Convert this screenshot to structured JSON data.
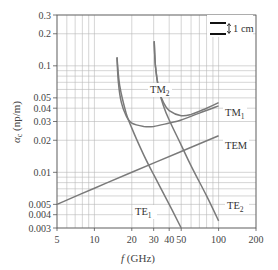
{
  "chart_data": {
    "type": "line",
    "title": "",
    "xlabel": "f (GHz)",
    "ylabel": "αc (np/m)",
    "xscale": "log",
    "yscale": "log",
    "xlim": [
      5,
      200
    ],
    "ylim": [
      0.003,
      0.3
    ],
    "grid": true,
    "x_ticks": [
      5,
      10,
      20,
      30,
      40,
      50,
      100,
      200
    ],
    "x_tick_labels": [
      "5",
      "10",
      "20",
      "30",
      "40",
      "50",
      "100",
      "200"
    ],
    "y_ticks": [
      0.003,
      0.004,
      0.005,
      0.01,
      0.02,
      0.03,
      0.04,
      0.05,
      0.1,
      0.2,
      0.3
    ],
    "y_tick_labels": [
      "0.003",
      "0.004",
      "0.005",
      "0.01",
      "0.02",
      "0.03",
      "0.04",
      "0.05",
      "0.1",
      "0.2",
      "0.3"
    ],
    "legend_annotation": "1 cm",
    "series": [
      {
        "name": "TEM",
        "label": "TEM",
        "x": [
          5,
          10,
          20,
          50,
          100
        ],
        "y": [
          0.005,
          0.0071,
          0.01,
          0.0157,
          0.022
        ]
      },
      {
        "name": "TE1",
        "label": "TE",
        "subscript": "1",
        "x": [
          15.2,
          16,
          18,
          20,
          25,
          30,
          40,
          50
        ],
        "y": [
          0.12,
          0.065,
          0.036,
          0.026,
          0.0145,
          0.0095,
          0.005,
          0.003
        ]
      },
      {
        "name": "TM1",
        "label": "TM",
        "subscript": "1",
        "x": [
          15.2,
          15.6,
          16.5,
          18,
          20,
          25,
          30,
          40,
          50,
          70,
          100
        ],
        "y": [
          0.12,
          0.07,
          0.045,
          0.034,
          0.029,
          0.027,
          0.027,
          0.029,
          0.031,
          0.036,
          0.042
        ]
      },
      {
        "name": "TM2",
        "label": "TM",
        "subscript": "2",
        "x": [
          30.3,
          31,
          33,
          36,
          40,
          50,
          60,
          80,
          100
        ],
        "y": [
          0.17,
          0.1,
          0.06,
          0.045,
          0.038,
          0.034,
          0.035,
          0.04,
          0.045
        ]
      },
      {
        "name": "TE2",
        "label": "TE",
        "subscript": "2",
        "x": [
          30.3,
          31,
          33,
          36,
          40,
          50,
          60,
          80,
          100
        ],
        "y": [
          0.17,
          0.1,
          0.06,
          0.042,
          0.031,
          0.018,
          0.0115,
          0.006,
          0.0035
        ]
      }
    ],
    "curve_label_positions": {
      "TM2": [
        150,
        93
      ],
      "TM1": [
        225,
        116
      ],
      "TEM": [
        225,
        149
      ],
      "TE1": [
        135,
        215
      ],
      "TE2": [
        227,
        209
      ]
    },
    "colors": {
      "curve": "#7a7a7a",
      "grid": "#b8b8b8",
      "axis": "#555555",
      "background": "#ffffff"
    }
  }
}
